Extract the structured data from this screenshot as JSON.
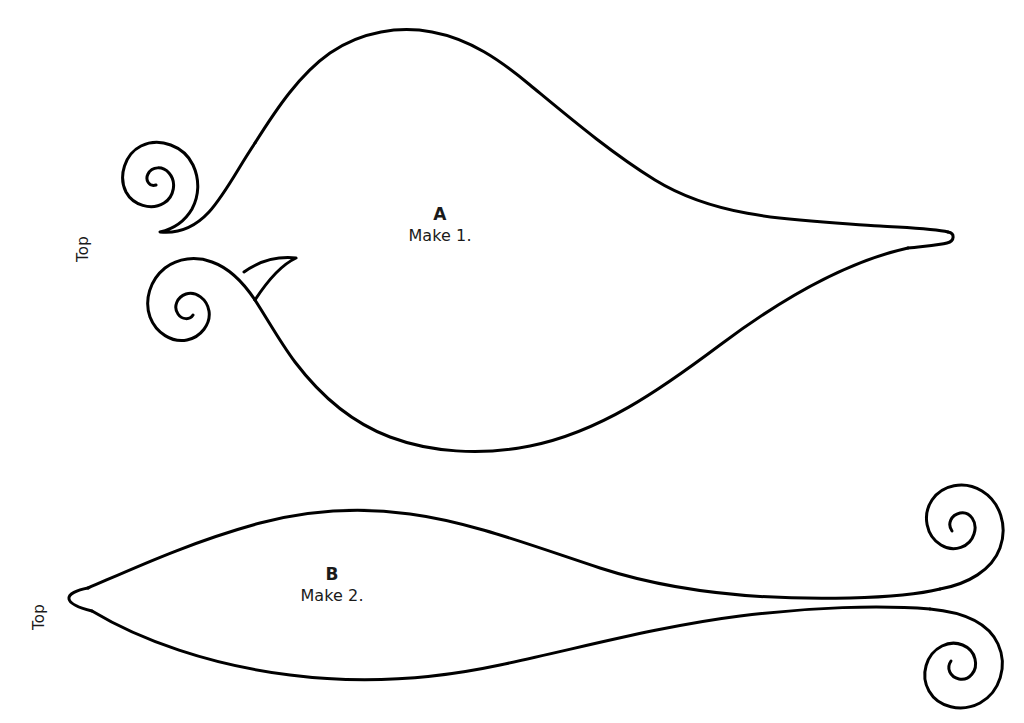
{
  "document": {
    "kind": "sewing-pattern-template",
    "background_color": "#ffffff",
    "stroke_color": "#000000",
    "canvas": {
      "width": 1024,
      "height": 723
    }
  },
  "pieces": [
    {
      "id": "A",
      "letter": "A",
      "instruction": "Make 1.",
      "top_label": "Top",
      "description": "Large leaf / fish shaped pattern piece with two spiral scroll ends on the left and a sharp point on the right"
    },
    {
      "id": "B",
      "letter": "B",
      "instruction": "Make 2.",
      "top_label": "Top",
      "description": "Slender leaf shaped pattern piece with a sharp point on the left and two spiral scroll ends on the right"
    }
  ],
  "footer": {
    "watermark": ""
  }
}
